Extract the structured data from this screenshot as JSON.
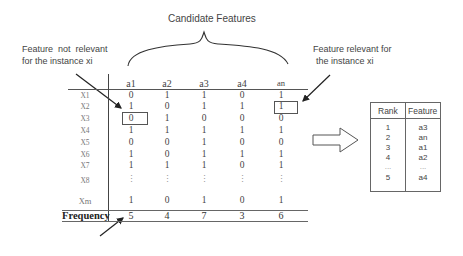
{
  "title": "Candidate Features",
  "annotations": {
    "not_relevant_line1": "Feature  not  relevant",
    "not_relevant_line2": "for the instance xi",
    "relevant_line1": "Feature relevant for",
    "relevant_line2": "the instance xi"
  },
  "matrix": {
    "columns": [
      "a1",
      "a2",
      "a3",
      "a4",
      "an"
    ],
    "rows": [
      {
        "label": "X1",
        "values": [
          "0",
          "1",
          "1",
          "0",
          "1"
        ]
      },
      {
        "label": "X2",
        "values": [
          "1",
          "0",
          "1",
          "1",
          "1"
        ]
      },
      {
        "label": "X3",
        "values": [
          "0",
          "1",
          "0",
          "0",
          "0"
        ]
      },
      {
        "label": "X4",
        "values": [
          "1",
          "1",
          "1",
          "1",
          "1"
        ]
      },
      {
        "label": "X5",
        "values": [
          "0",
          "0",
          "1",
          "0",
          "0"
        ]
      },
      {
        "label": "X6",
        "values": [
          "1",
          "0",
          "1",
          "1",
          "1"
        ]
      },
      {
        "label": "X7",
        "values": [
          "1",
          "1",
          "1",
          "0",
          "1"
        ]
      },
      {
        "label": "X8",
        "values": [
          "⋮",
          "⋮",
          "⋮",
          "⋮",
          "⋮"
        ]
      },
      {
        "label": "Xm",
        "values": [
          "1",
          "0",
          "1",
          "0",
          "1"
        ]
      }
    ],
    "frequency_label": "Frequency",
    "frequency": [
      "5",
      "4",
      "7",
      "3",
      "6"
    ],
    "highlighted_cells": [
      {
        "row": "X3",
        "column": "a1",
        "value": "0",
        "meaning": "not relevant"
      },
      {
        "row": "X2",
        "column": "an",
        "value": "1",
        "meaning": "relevant"
      }
    ]
  },
  "ranking": {
    "headers": [
      "Rank",
      "Feature"
    ],
    "rows": [
      {
        "rank": "1",
        "feature": "a3"
      },
      {
        "rank": "2",
        "feature": "an"
      },
      {
        "rank": "3",
        "feature": "a1"
      },
      {
        "rank": "4",
        "feature": "a2"
      },
      {
        "rank": "...",
        "feature": "..."
      },
      {
        "rank": "5",
        "feature": "a4"
      }
    ]
  }
}
